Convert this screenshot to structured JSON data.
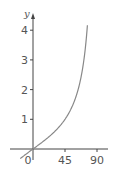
{
  "chart_data": {
    "type": "line",
    "title": "",
    "xlabel": "",
    "ylabel": "y",
    "function": "tan(x)",
    "x_ticks": [
      0,
      45,
      90
    ],
    "x_tick_labels": [
      "0",
      "45",
      "90"
    ],
    "y_ticks": [
      1,
      2,
      3,
      4
    ],
    "y_tick_labels": [
      "1",
      "2",
      "3",
      "4"
    ],
    "xlim": [
      -20,
      100
    ],
    "ylim": [
      -0.6,
      4.3
    ],
    "grid": false,
    "series": [
      {
        "name": "tan x",
        "x": [
          -15,
          0,
          15,
          30,
          45,
          55,
          60,
          65,
          70,
          75,
          77,
          80
        ],
        "values": [
          -0.27,
          0,
          0.27,
          0.58,
          1.0,
          1.43,
          1.73,
          2.14,
          2.75,
          3.73,
          4.33,
          5.67
        ]
      }
    ],
    "colors": {
      "axis": "#444444",
      "curve": "#888888"
    }
  }
}
